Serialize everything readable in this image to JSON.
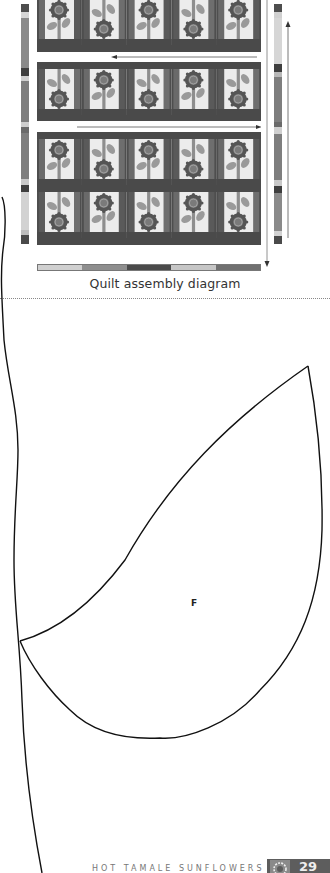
{
  "diagram": {
    "caption": "Quilt assembly diagram",
    "rows": 4,
    "columns": 5,
    "row_orientation": [
      [
        "up",
        "down",
        "up",
        "down",
        "up"
      ],
      [
        "down",
        "up",
        "down",
        "up",
        "down"
      ],
      [
        "up",
        "down",
        "up",
        "down",
        "up"
      ],
      [
        "down",
        "up",
        "down",
        "up",
        "down"
      ]
    ],
    "arrows": [
      {
        "direction": "left",
        "label": "row-1-2-arrow"
      },
      {
        "direction": "right",
        "label": "row-2-3-arrow"
      },
      {
        "direction": "up",
        "label": "right-border-up-arrow"
      },
      {
        "direction": "down",
        "label": "right-edge-down-arrow"
      }
    ],
    "colors": {
      "sashing_dark": "#4a4a4a",
      "sashing_mid": "#6e6e6e",
      "background": "#eeeeee",
      "petal": "#5c5c5c",
      "center": "#7a7a7a",
      "leaf": "#9a9a9a",
      "stem": "#8c8c8c",
      "light": "#d8d8d8"
    }
  },
  "template": {
    "piece_label": "F"
  },
  "footer": {
    "title": "HOT TAMALE SUNFLOWERS",
    "page_number": "29"
  }
}
